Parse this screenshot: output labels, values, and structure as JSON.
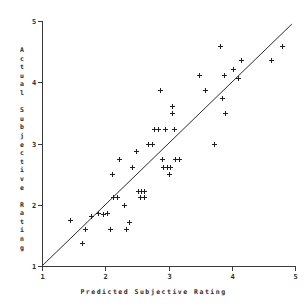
{
  "chart_data": {
    "type": "scatter",
    "title": "",
    "xlabel": "Predicted Subjective Rating",
    "ylabel": "Actual Subjective Rating",
    "xlim": [
      1,
      5
    ],
    "ylim": [
      1,
      5
    ],
    "xticks": [
      "1",
      "2",
      "3",
      "4",
      "5"
    ],
    "yticks": [
      "1",
      "2",
      "3",
      "4",
      "5"
    ],
    "xtick_values": [
      1,
      2,
      3,
      4,
      5
    ],
    "ytick_values": [
      1,
      2,
      3,
      4,
      5
    ],
    "grid": false,
    "legend": null,
    "marker": "plus",
    "reference_line": {
      "name": "identity-line",
      "from": [
        1,
        1
      ],
      "to": [
        4.95,
        4.95
      ]
    },
    "points": [
      [
        1.45,
        1.75
      ],
      [
        1.63,
        1.37
      ],
      [
        1.68,
        1.6
      ],
      [
        1.78,
        1.82
      ],
      [
        1.88,
        1.86
      ],
      [
        1.97,
        1.85
      ],
      [
        2.03,
        1.86
      ],
      [
        2.07,
        1.6
      ],
      [
        2.1,
        2.5
      ],
      [
        2.12,
        2.12
      ],
      [
        2.18,
        2.12
      ],
      [
        2.22,
        2.75
      ],
      [
        2.3,
        2.0
      ],
      [
        2.33,
        1.6
      ],
      [
        2.38,
        1.72
      ],
      [
        2.42,
        2.62
      ],
      [
        2.48,
        2.87
      ],
      [
        2.52,
        2.22
      ],
      [
        2.57,
        2.22
      ],
      [
        2.62,
        2.22
      ],
      [
        2.55,
        2.12
      ],
      [
        2.62,
        2.12
      ],
      [
        2.68,
        3.0
      ],
      [
        2.74,
        3.0
      ],
      [
        2.77,
        3.24
      ],
      [
        2.83,
        3.24
      ],
      [
        2.86,
        3.87
      ],
      [
        2.9,
        2.74
      ],
      [
        2.92,
        2.62
      ],
      [
        2.95,
        3.24
      ],
      [
        2.97,
        2.62
      ],
      [
        3.0,
        2.5
      ],
      [
        3.03,
        2.62
      ],
      [
        3.05,
        3.5
      ],
      [
        3.06,
        3.62
      ],
      [
        3.08,
        3.24
      ],
      [
        3.1,
        2.74
      ],
      [
        3.16,
        2.74
      ],
      [
        3.48,
        4.12
      ],
      [
        3.57,
        3.87
      ],
      [
        3.72,
        3.0
      ],
      [
        3.82,
        4.6
      ],
      [
        3.85,
        3.74
      ],
      [
        3.88,
        4.12
      ],
      [
        3.9,
        3.5
      ],
      [
        4.02,
        4.22
      ],
      [
        4.1,
        4.07
      ],
      [
        4.15,
        4.37
      ],
      [
        4.62,
        4.37
      ],
      [
        4.8,
        4.6
      ]
    ]
  },
  "axis": {
    "x_title": "Predicted Subjective Rating",
    "y_title_chars": [
      "A",
      "c",
      "t",
      "u",
      "a",
      "l",
      "",
      "S",
      "u",
      "b",
      "j",
      "e",
      "c",
      "t",
      "i",
      "v",
      "e",
      "",
      "R",
      "a",
      "t",
      "i",
      "n",
      "g"
    ]
  },
  "colors": {
    "marker": "#1f1f1f",
    "axis": "#3a3a3a",
    "line": "#2b2b2b",
    "background": "#ffffff"
  }
}
